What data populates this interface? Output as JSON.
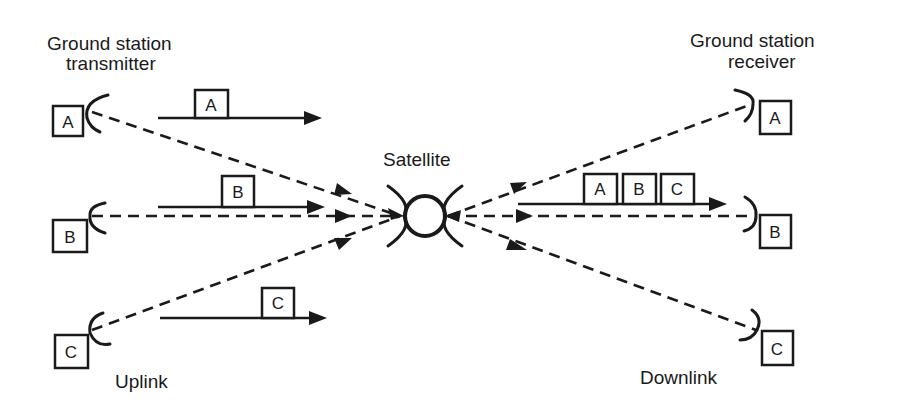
{
  "title_left": [
    "Ground station",
    "transmitter"
  ],
  "title_right": [
    "Ground station",
    "receiver"
  ],
  "satellite_label": "Satellite",
  "uplink_label": "Uplink",
  "downlink_label": "Downlink",
  "transmitters": [
    {
      "id": "A",
      "packet": "A"
    },
    {
      "id": "B",
      "packet": "B"
    },
    {
      "id": "C",
      "packet": "C"
    }
  ],
  "receivers": [
    {
      "id": "A"
    },
    {
      "id": "B"
    },
    {
      "id": "C"
    }
  ],
  "downlink_packets": [
    "A",
    "B",
    "C"
  ]
}
